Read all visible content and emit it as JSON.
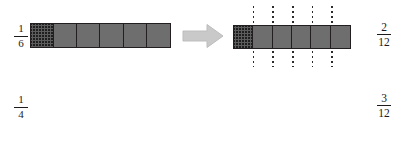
{
  "diagram": {
    "colors": {
      "bar_fill": "#6e6e6e",
      "bar_outline": "#231f20",
      "hatch_ink": "#141414",
      "arrow_fill": "#c9c9c9",
      "arrow_outline": "#b3b3b3",
      "dotted_line": "#2b2b2b",
      "background": "#ffffff",
      "text": "#1b1b1b"
    },
    "rows": [
      {
        "id": "sixths",
        "source": {
          "fraction_numerator": "1",
          "fraction_denominator": "6",
          "total_segments": 6,
          "shaded_segments": 1,
          "shaded_indices": [
            0
          ],
          "fill_style": "cross-hatch"
        },
        "arrow": {
          "direction": "right",
          "label": ""
        },
        "result": {
          "fraction_numerator": "2",
          "fraction_denominator": "12",
          "total_segments": 6,
          "shaded_segments": 1,
          "shaded_indices": [
            0
          ],
          "subdivisions_per_segment": 2,
          "total_parts": 12,
          "shaded_parts": 2,
          "dotted_line_count": 5,
          "dotted_line_positions_pct": [
            16.666,
            33.333,
            50.0,
            66.666,
            83.333
          ]
        }
      },
      {
        "id": "fourths",
        "source": {
          "fraction_numerator": "1",
          "fraction_denominator": "4",
          "total_segments": 4,
          "shaded_segments": 1,
          "shaded_indices": [
            0
          ],
          "fill_style": "cross-hatch"
        },
        "arrow": {
          "direction": "right",
          "label": ""
        },
        "result": {
          "fraction_numerator": "3",
          "fraction_denominator": "12",
          "total_segments": 4,
          "shaded_segments": 1,
          "shaded_indices": [
            0
          ],
          "subdivisions_per_segment": 3,
          "total_parts": 12,
          "shaded_parts": 3,
          "dotted_line_count": 8,
          "dotted_line_positions_pct": [
            8.333,
            16.666,
            33.333,
            41.666,
            58.333,
            66.666,
            83.333,
            91.666
          ]
        }
      }
    ],
    "icons": {
      "arrow": "arrow-right-icon"
    }
  }
}
